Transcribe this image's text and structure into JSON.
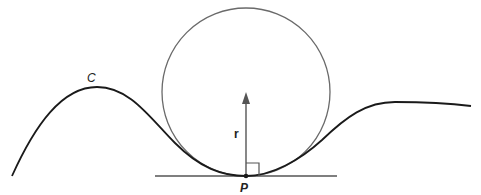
{
  "diagram": {
    "labels": {
      "curve": "C",
      "radius": "r",
      "point": "P"
    },
    "colors": {
      "curve": "#1a1a1a",
      "circle": "#6a6a6a",
      "tangent": "#555555",
      "arrow": "#555555",
      "background": "#ffffff"
    },
    "elements": [
      {
        "type": "curve",
        "label": "C"
      },
      {
        "type": "osculating-circle"
      },
      {
        "type": "tangent-line",
        "at": "P"
      },
      {
        "type": "radius-vector",
        "label": "r"
      },
      {
        "type": "right-angle-marker",
        "at": "P"
      },
      {
        "type": "point",
        "label": "P"
      }
    ]
  }
}
